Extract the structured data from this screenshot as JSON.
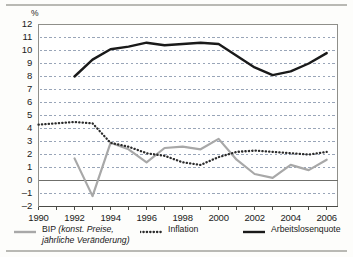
{
  "header": {
    "unit_label": "%"
  },
  "axes": {
    "y_ticks": [
      "12",
      "11",
      "10",
      "9",
      "8",
      "7",
      "6",
      "5",
      "4",
      "3",
      "2",
      "1",
      "0",
      "-1",
      "-2"
    ],
    "x_ticks": [
      "1990",
      "1992",
      "1994",
      "1996",
      "1998",
      "2000",
      "2002",
      "2004",
      "2006"
    ]
  },
  "legend": {
    "items": [
      {
        "key": "solid-gray-line",
        "label": "BIP (konst. Preise,",
        "label2": "jährliche Veränderung)",
        "color": "#a8a8a8"
      },
      {
        "key": "dotted-line",
        "label": "Inflation",
        "color": "#2b2b2b"
      },
      {
        "key": "solid-black-line",
        "label": "Arbeitslosenquote",
        "color": "#1a1a1a"
      }
    ]
  },
  "chart_data": {
    "type": "line",
    "title": "",
    "xlabel": "",
    "ylabel": "%",
    "xlim": [
      1990,
      2006.6
    ],
    "ylim": [
      -2,
      12
    ],
    "grid": true,
    "zero_line": true,
    "legend_position": "bottom",
    "x": [
      1990,
      1991,
      1992,
      1993,
      1994,
      1995,
      1996,
      1997,
      1998,
      1999,
      2000,
      2001,
      2002,
      2003,
      2004,
      2005,
      2006
    ],
    "series": [
      {
        "name": "BIP (konst. Preise, jährliche Veränderung)",
        "style": "solid",
        "color": "#a8a8a8",
        "width": 2.2,
        "x": [
          1992,
          1993,
          1994,
          1995,
          1996,
          1997,
          1998,
          1999,
          2000,
          2001,
          2002,
          2003,
          2004,
          2005,
          2006
        ],
        "values": [
          1.7,
          -1.2,
          2.9,
          2.4,
          1.4,
          2.5,
          2.6,
          2.4,
          3.2,
          1.6,
          0.5,
          0.2,
          1.2,
          0.8,
          1.6
        ]
      },
      {
        "name": "Inflation",
        "style": "dotted",
        "color": "#2b2b2b",
        "width": 2.0,
        "x": [
          1990,
          1991,
          1992,
          1993,
          1994,
          1995,
          1996,
          1997,
          1998,
          1999,
          2000,
          2001,
          2002,
          2003,
          2004,
          2005,
          2006
        ],
        "values": [
          4.3,
          4.4,
          4.5,
          4.4,
          2.9,
          2.6,
          2.1,
          1.9,
          1.4,
          1.2,
          1.8,
          2.2,
          2.3,
          2.2,
          2.1,
          2.0,
          2.2
        ]
      },
      {
        "name": "Arbeitslosenquote",
        "style": "solid",
        "color": "#1a1a1a",
        "width": 2.4,
        "x": [
          1992,
          1993,
          1994,
          1995,
          1996,
          1997,
          1998,
          1999,
          2000,
          2001,
          2002,
          2003,
          2004,
          2005,
          2006
        ],
        "values": [
          8.0,
          9.3,
          10.1,
          10.3,
          10.6,
          10.4,
          10.5,
          10.6,
          10.5,
          9.6,
          8.7,
          8.1,
          8.4,
          9.0,
          9.8
        ]
      }
    ]
  }
}
